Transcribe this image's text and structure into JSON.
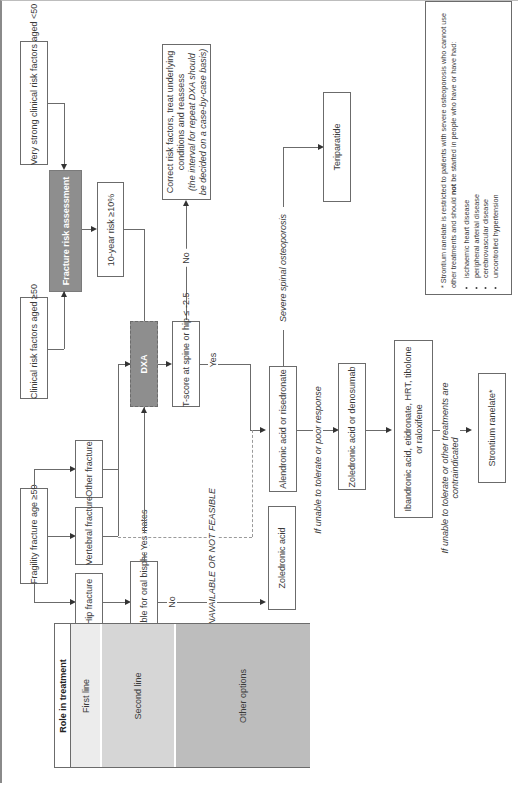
{
  "diagram": {
    "orientation": "rotated 90 degrees clockwise",
    "nodes": {
      "very_strong_risk": "Very strong clinical risk factors aged <50",
      "clinical_risk": "Clinical risk factors aged ≥50",
      "fracture_risk_assessment": "Fracture risk assessment",
      "ten_year_risk": "10-year risk ≥10%",
      "dxa": "DXA",
      "tscore": "T-score at spine or hip ≤ -2.5",
      "correct_risk_line1": "Correct risk factors, treat underlying",
      "correct_risk_line2": "conditions and reassess",
      "correct_risk_line3": "(the interval for repeat DXA should",
      "correct_risk_line4": "be decided on a case-by-case basis)",
      "fragility_fracture": "Fragility fracture age ≥50",
      "hip_fracture": "Hip fracture",
      "vertebral_fracture": "Vertebral fracture",
      "other_fracture": "Other fracture",
      "suitable_oral": "Suitable for oral bisphosphonates",
      "alendronic": "Alendronic acid or risedronate",
      "zoledronic_denosumab": "Zoledronic acid or denosumab",
      "ibandronic_line1": "Ibandronic acid, etidronate, HRT, tibolone",
      "ibandronic_line2": "or raloxifene",
      "strontium": "Strontium ranelate*",
      "teriparatide": "Teriparatide",
      "zoledronic": "Zoledronic acid"
    },
    "edge_labels": {
      "no_top": "No",
      "yes_tscore": "Yes",
      "yes_suitable": "Yes",
      "no_suitable": "No",
      "severe_spinal": "Severe spinal osteoporosis",
      "unable_poor": "If unable to tolerate or poor response",
      "unable_contra_line1": "If unable to tolerate or other treatments are",
      "unable_contra_line2": "contraindicated",
      "dxa_unavailable": "DXA UNAVAILABLE OR NOT FEASIBLE"
    },
    "footnote": {
      "intro_part1": "* Strontium ranelate is restricted to patients with severe osteoporosis who cannot use other treatments and should ",
      "intro_bold": "not",
      "intro_part2": " be started in people who have or have had:",
      "items": [
        "ischaemic heart disease",
        "peripheral arterial disease",
        "cerebrovascular disease",
        "uncontrolled hypertension"
      ]
    },
    "legend": {
      "title": "Role in treatment",
      "rows": [
        {
          "label": "First line",
          "color": "#ececec"
        },
        {
          "label": "Second line",
          "color": "#d6d6d6"
        },
        {
          "label": "Other options",
          "color": "#bdbdbd"
        }
      ]
    },
    "colors": {
      "assessment_fill": "#8e8e8e",
      "dxa_fill": "#8e8e8e",
      "line": "#6b6b6b"
    }
  }
}
